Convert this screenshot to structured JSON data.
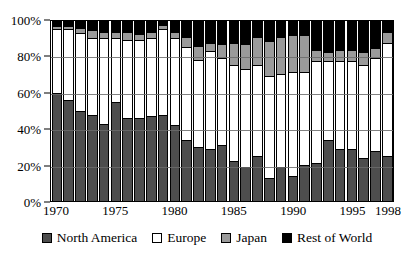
{
  "chart_data": {
    "type": "bar",
    "variant": "stacked-100-percent",
    "title": "",
    "xlabel": "",
    "ylabel": "",
    "ylim": [
      0,
      100
    ],
    "ytick_labels": [
      "0%",
      "20%",
      "40%",
      "60%",
      "80%",
      "100%"
    ],
    "ytick_values": [
      0,
      20,
      40,
      60,
      80,
      100
    ],
    "grid": true,
    "grid_axis": "y",
    "legend_position": "bottom",
    "categories": [
      "1970",
      "1971",
      "1972",
      "1973",
      "1974",
      "1975",
      "1976",
      "1977",
      "1978",
      "1979",
      "1980",
      "1981",
      "1982",
      "1983",
      "1984",
      "1985",
      "1986",
      "1987",
      "1988",
      "1989",
      "1990",
      "1991",
      "1992",
      "1993",
      "1994",
      "1995",
      "1996",
      "1997",
      "1998"
    ],
    "xtick_labels": [
      "1970",
      "1975",
      "1980",
      "1985",
      "1990",
      "1995",
      "1998"
    ],
    "xtick_categories": [
      "1970",
      "1975",
      "1980",
      "1985",
      "1990",
      "1995",
      "1998"
    ],
    "series": [
      {
        "name": "North America",
        "color": "#4d4d4d",
        "values": [
          60,
          56,
          50,
          48,
          43,
          55,
          46,
          46,
          47,
          48,
          42,
          34,
          30,
          29,
          31,
          22,
          19,
          25,
          13,
          19,
          14,
          20,
          21,
          34,
          29,
          29,
          24,
          28,
          25
        ]
      },
      {
        "name": "Europe",
        "color": "#ffffff",
        "values": [
          35,
          39,
          43,
          42,
          47,
          35,
          43,
          43,
          43,
          47,
          48,
          51,
          48,
          54,
          48,
          53,
          54,
          50,
          56,
          51,
          57,
          51,
          56,
          43,
          48,
          48,
          51,
          51,
          62
        ]
      },
      {
        "name": "Japan",
        "color": "#9a9a9a",
        "values": [
          2,
          2,
          3,
          5,
          4,
          4,
          5,
          4,
          4,
          3,
          4,
          6,
          8,
          5,
          8,
          13,
          14,
          16,
          20,
          21,
          21,
          21,
          7,
          6,
          7,
          7,
          8,
          6,
          7
        ]
      },
      {
        "name": "Rest of World",
        "color": "#000000",
        "values": [
          3,
          3,
          4,
          5,
          6,
          6,
          6,
          7,
          6,
          2,
          6,
          9,
          14,
          12,
          13,
          12,
          13,
          9,
          11,
          9,
          8,
          8,
          16,
          17,
          16,
          16,
          17,
          15,
          6
        ]
      }
    ]
  },
  "legend": {
    "items": [
      {
        "label": "North America",
        "swatch": "#4d4d4d"
      },
      {
        "label": "Europe",
        "swatch": "#ffffff"
      },
      {
        "label": "Japan",
        "swatch": "#9a9a9a"
      },
      {
        "label": "Rest of World",
        "swatch": "#000000"
      }
    ]
  }
}
